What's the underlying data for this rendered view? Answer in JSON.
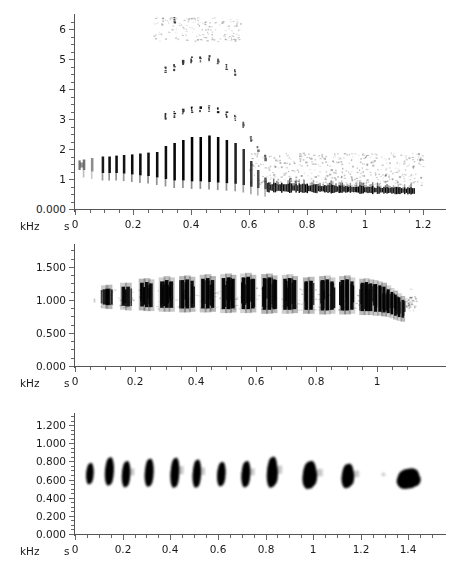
{
  "figure": {
    "title": "",
    "panel_count": 3,
    "background_color": "#ffffff",
    "ink_color": "#000000",
    "axis_color": "#555555"
  },
  "chart_data": [
    {
      "type": "heatmap",
      "title": "",
      "subtitle": "Spectrogram panel 1 - harmonic call with broadband pulse train",
      "xlabel": "s",
      "ylabel": "kHz",
      "xlim": [
        0,
        1.24
      ],
      "ylim": [
        0.0,
        6.4
      ],
      "xticks": [
        0,
        0.2,
        0.4,
        0.6,
        0.8,
        1,
        1.2
      ],
      "xticklabels": [
        "0",
        "0.2",
        "0.4",
        "0.6",
        "0.8",
        "1",
        "1.2"
      ],
      "xminor_step": 0.05,
      "yticks": [
        0,
        1,
        2,
        3,
        4,
        5,
        6
      ],
      "yticklabels": [
        "0.000",
        "1",
        "2",
        "3",
        "4",
        "5",
        "6"
      ],
      "yminor_step": 0.25,
      "grid": false,
      "legend": "none",
      "unit_x": "s",
      "unit_y": "kHz",
      "pulses": [
        {
          "t": 0.03,
          "f_low": 1.3,
          "f_high": 1.65,
          "top_harm": 1.8,
          "intensity": 0.55
        },
        {
          "t": 0.058,
          "f_low": 1.25,
          "f_high": 1.7,
          "top_harm": 1.9,
          "intensity": 0.45
        },
        {
          "t": 0.095,
          "f_low": 1.2,
          "f_high": 1.75,
          "top_harm": 2.0,
          "intensity": 0.9
        },
        {
          "t": 0.118,
          "f_low": 1.2,
          "f_high": 1.75,
          "top_harm": 2.0,
          "intensity": 0.95
        },
        {
          "t": 0.142,
          "f_low": 1.2,
          "f_high": 1.78,
          "top_harm": 2.1,
          "intensity": 0.95
        },
        {
          "t": 0.168,
          "f_low": 1.18,
          "f_high": 1.8,
          "top_harm": 2.2,
          "intensity": 0.92
        },
        {
          "t": 0.196,
          "f_low": 1.15,
          "f_high": 1.82,
          "top_harm": 2.3,
          "intensity": 0.95
        },
        {
          "t": 0.224,
          "f_low": 1.12,
          "f_high": 1.85,
          "top_harm": 2.4,
          "intensity": 0.95
        },
        {
          "t": 0.252,
          "f_low": 1.1,
          "f_high": 1.88,
          "top_harm": 2.5,
          "intensity": 0.95
        },
        {
          "t": 0.282,
          "f_low": 1.05,
          "f_high": 1.9,
          "top_harm": 2.8,
          "intensity": 0.95
        },
        {
          "t": 0.312,
          "f_low": 1.0,
          "f_high": 2.1,
          "top_harm": 4.6,
          "intensity": 0.95
        },
        {
          "t": 0.342,
          "f_low": 0.95,
          "f_high": 2.2,
          "top_harm": 6.3,
          "intensity": 0.98
        },
        {
          "t": 0.372,
          "f_low": 0.95,
          "f_high": 2.3,
          "top_harm": 6.3,
          "intensity": 0.98
        },
        {
          "t": 0.402,
          "f_low": 0.92,
          "f_high": 2.4,
          "top_harm": 6.3,
          "intensity": 1.0
        },
        {
          "t": 0.432,
          "f_low": 0.92,
          "f_high": 2.4,
          "top_harm": 6.3,
          "intensity": 1.0
        },
        {
          "t": 0.462,
          "f_low": 0.9,
          "f_high": 2.45,
          "top_harm": 6.3,
          "intensity": 1.0
        },
        {
          "t": 0.492,
          "f_low": 0.88,
          "f_high": 2.4,
          "top_harm": 6.3,
          "intensity": 0.98
        },
        {
          "t": 0.522,
          "f_low": 0.86,
          "f_high": 2.3,
          "top_harm": 6.0,
          "intensity": 0.95
        },
        {
          "t": 0.552,
          "f_low": 0.84,
          "f_high": 2.2,
          "top_harm": 5.4,
          "intensity": 0.88
        },
        {
          "t": 0.58,
          "f_low": 0.8,
          "f_high": 2.0,
          "top_harm": 3.1,
          "intensity": 0.8
        },
        {
          "t": 0.606,
          "f_low": 0.74,
          "f_high": 1.6,
          "top_harm": 2.6,
          "intensity": 0.75
        },
        {
          "t": 0.63,
          "f_low": 0.7,
          "f_high": 1.3,
          "top_harm": 2.1,
          "intensity": 0.7
        },
        {
          "t": 0.655,
          "f_low": 0.66,
          "f_high": 1.05,
          "top_harm": 1.6,
          "intensity": 0.65
        }
      ],
      "tail_band": {
        "t_start": 0.66,
        "t_end": 1.17,
        "f_center": 0.62,
        "f_width": 0.22,
        "note": "dense low-frequency pulse band descending to ~0.55 kHz"
      },
      "noise_band": {
        "t_start": 0.6,
        "t_end": 1.2,
        "f_center": 1.35,
        "f_width": 0.5,
        "note": "faint grey broadband residue"
      }
    },
    {
      "type": "heatmap",
      "title": "",
      "subtitle": "Spectrogram panel 2 - narrowband pulse train near 1 kHz",
      "xlabel": "s",
      "ylabel": "kHz",
      "xlim": [
        0,
        1.14
      ],
      "ylim": [
        0.0,
        1.8
      ],
      "xticks": [
        0,
        0.2,
        0.4,
        0.6,
        0.8,
        1
      ],
      "xticklabels": [
        "0",
        "0.2",
        "0.4",
        "0.6",
        "0.8",
        "1"
      ],
      "xminor_step": 0.05,
      "yticks": [
        0,
        0.5,
        1.0,
        1.5
      ],
      "yticklabels": [
        "0.000",
        "0.500",
        "1.000",
        "1.500"
      ],
      "yminor_step": 0.125,
      "grid": false,
      "legend": "none",
      "unit_x": "s",
      "unit_y": "kHz",
      "pulses": [
        {
          "t": 0.098,
          "f_low": 0.93,
          "f_high": 1.16,
          "intensity": 0.85,
          "width": 0.013
        },
        {
          "t": 0.112,
          "f_low": 0.92,
          "f_high": 1.17,
          "intensity": 0.88,
          "width": 0.012
        },
        {
          "t": 0.16,
          "f_low": 0.91,
          "f_high": 1.2,
          "intensity": 0.9,
          "width": 0.012
        },
        {
          "t": 0.176,
          "f_low": 0.9,
          "f_high": 1.2,
          "intensity": 0.9,
          "width": 0.012
        },
        {
          "t": 0.222,
          "f_low": 0.9,
          "f_high": 1.26,
          "intensity": 0.92,
          "width": 0.012
        },
        {
          "t": 0.238,
          "f_low": 0.89,
          "f_high": 1.27,
          "intensity": 0.93,
          "width": 0.012
        },
        {
          "t": 0.252,
          "f_low": 0.89,
          "f_high": 1.25,
          "intensity": 0.9,
          "width": 0.011
        },
        {
          "t": 0.288,
          "f_low": 0.88,
          "f_high": 1.28,
          "intensity": 0.93,
          "width": 0.012
        },
        {
          "t": 0.304,
          "f_low": 0.88,
          "f_high": 1.3,
          "intensity": 0.95,
          "width": 0.012
        },
        {
          "t": 0.32,
          "f_low": 0.88,
          "f_high": 1.28,
          "intensity": 0.92,
          "width": 0.011
        },
        {
          "t": 0.356,
          "f_low": 0.87,
          "f_high": 1.3,
          "intensity": 0.95,
          "width": 0.012
        },
        {
          "t": 0.372,
          "f_low": 0.87,
          "f_high": 1.31,
          "intensity": 0.95,
          "width": 0.012
        },
        {
          "t": 0.388,
          "f_low": 0.88,
          "f_high": 1.29,
          "intensity": 0.92,
          "width": 0.011
        },
        {
          "t": 0.424,
          "f_low": 0.87,
          "f_high": 1.32,
          "intensity": 0.95,
          "width": 0.012
        },
        {
          "t": 0.44,
          "f_low": 0.87,
          "f_high": 1.33,
          "intensity": 0.96,
          "width": 0.012
        },
        {
          "t": 0.456,
          "f_low": 0.88,
          "f_high": 1.3,
          "intensity": 0.92,
          "width": 0.011
        },
        {
          "t": 0.492,
          "f_low": 0.86,
          "f_high": 1.33,
          "intensity": 0.96,
          "width": 0.012
        },
        {
          "t": 0.508,
          "f_low": 0.86,
          "f_high": 1.34,
          "intensity": 0.97,
          "width": 0.012
        },
        {
          "t": 0.524,
          "f_low": 0.87,
          "f_high": 1.32,
          "intensity": 0.94,
          "width": 0.011
        },
        {
          "t": 0.558,
          "f_low": 0.86,
          "f_high": 1.34,
          "intensity": 0.97,
          "width": 0.012
        },
        {
          "t": 0.574,
          "f_low": 0.86,
          "f_high": 1.35,
          "intensity": 0.97,
          "width": 0.012
        },
        {
          "t": 0.59,
          "f_low": 0.87,
          "f_high": 1.32,
          "intensity": 0.94,
          "width": 0.011
        },
        {
          "t": 0.628,
          "f_low": 0.85,
          "f_high": 1.33,
          "intensity": 0.96,
          "width": 0.012
        },
        {
          "t": 0.644,
          "f_low": 0.85,
          "f_high": 1.34,
          "intensity": 0.97,
          "width": 0.012
        },
        {
          "t": 0.66,
          "f_low": 0.86,
          "f_high": 1.31,
          "intensity": 0.94,
          "width": 0.011
        },
        {
          "t": 0.696,
          "f_low": 0.85,
          "f_high": 1.32,
          "intensity": 0.95,
          "width": 0.012
        },
        {
          "t": 0.712,
          "f_low": 0.85,
          "f_high": 1.33,
          "intensity": 0.96,
          "width": 0.012
        },
        {
          "t": 0.728,
          "f_low": 0.86,
          "f_high": 1.3,
          "intensity": 0.93,
          "width": 0.011
        },
        {
          "t": 0.766,
          "f_low": 0.85,
          "f_high": 1.28,
          "intensity": 0.94,
          "width": 0.012
        },
        {
          "t": 0.782,
          "f_low": 0.85,
          "f_high": 1.29,
          "intensity": 0.95,
          "width": 0.012
        },
        {
          "t": 0.82,
          "f_low": 0.84,
          "f_high": 1.3,
          "intensity": 0.95,
          "width": 0.012
        },
        {
          "t": 0.836,
          "f_low": 0.84,
          "f_high": 1.31,
          "intensity": 0.96,
          "width": 0.012
        },
        {
          "t": 0.852,
          "f_low": 0.85,
          "f_high": 1.28,
          "intensity": 0.93,
          "width": 0.011
        },
        {
          "t": 0.886,
          "f_low": 0.84,
          "f_high": 1.3,
          "intensity": 0.95,
          "width": 0.012
        },
        {
          "t": 0.902,
          "f_low": 0.84,
          "f_high": 1.31,
          "intensity": 0.96,
          "width": 0.012
        },
        {
          "t": 0.918,
          "f_low": 0.85,
          "f_high": 1.28,
          "intensity": 0.93,
          "width": 0.011
        },
        {
          "t": 0.952,
          "f_low": 0.83,
          "f_high": 1.26,
          "intensity": 0.95,
          "width": 0.011
        },
        {
          "t": 0.966,
          "f_low": 0.83,
          "f_high": 1.27,
          "intensity": 0.96,
          "width": 0.011
        },
        {
          "t": 0.98,
          "f_low": 0.83,
          "f_high": 1.25,
          "intensity": 0.94,
          "width": 0.011
        },
        {
          "t": 0.996,
          "f_low": 0.82,
          "f_high": 1.24,
          "intensity": 0.95,
          "width": 0.01
        },
        {
          "t": 1.01,
          "f_low": 0.82,
          "f_high": 1.22,
          "intensity": 0.96,
          "width": 0.01
        },
        {
          "t": 1.024,
          "f_low": 0.81,
          "f_high": 1.2,
          "intensity": 0.97,
          "width": 0.01
        },
        {
          "t": 1.038,
          "f_low": 0.8,
          "f_high": 1.16,
          "intensity": 0.97,
          "width": 0.01
        },
        {
          "t": 1.05,
          "f_low": 0.78,
          "f_high": 1.12,
          "intensity": 0.97,
          "width": 0.009
        },
        {
          "t": 1.062,
          "f_low": 0.76,
          "f_high": 1.08,
          "intensity": 0.96,
          "width": 0.009
        },
        {
          "t": 1.074,
          "f_low": 0.74,
          "f_high": 1.04,
          "intensity": 0.94,
          "width": 0.009
        },
        {
          "t": 1.086,
          "f_low": 0.73,
          "f_high": 1.0,
          "intensity": 0.9,
          "width": 0.008
        }
      ]
    },
    {
      "type": "heatmap",
      "title": "",
      "subtitle": "Spectrogram panel 3 - discrete tonal notes near 0.65 kHz",
      "xlabel": "s",
      "ylabel": "kHz",
      "xlim": [
        0,
        1.52
      ],
      "ylim": [
        0.0,
        1.3
      ],
      "xticks": [
        0,
        0.2,
        0.4,
        0.6,
        0.8,
        1,
        1.2,
        1.4
      ],
      "xticklabels": [
        "0",
        "0.2",
        "0.4",
        "0.6",
        "0.8",
        "1",
        "1.2",
        "1.4"
      ],
      "xminor_step": 0.05,
      "yticks": [
        0,
        0.2,
        0.4,
        0.6,
        0.8,
        1.0,
        1.2
      ],
      "yticklabels": [
        "0.000",
        "0.200",
        "0.400",
        "0.600",
        "0.800",
        "1.000",
        "1.200"
      ],
      "yminor_step": 0.05,
      "grid": false,
      "legend": "none",
      "unit_x": "s",
      "unit_y": "kHz",
      "notes": [
        {
          "t": 0.063,
          "f": 0.665,
          "w": 0.03,
          "h": 0.115,
          "intensity": 1.0
        },
        {
          "t": 0.145,
          "f": 0.69,
          "w": 0.036,
          "h": 0.15,
          "intensity": 1.0
        },
        {
          "t": 0.215,
          "f": 0.66,
          "w": 0.034,
          "h": 0.14,
          "intensity": 1.0
        },
        {
          "t": 0.312,
          "f": 0.675,
          "w": 0.036,
          "h": 0.15,
          "intensity": 1.0
        },
        {
          "t": 0.42,
          "f": 0.675,
          "w": 0.036,
          "h": 0.16,
          "intensity": 1.0
        },
        {
          "t": 0.512,
          "f": 0.665,
          "w": 0.034,
          "h": 0.15,
          "intensity": 1.0
        },
        {
          "t": 0.615,
          "f": 0.66,
          "w": 0.034,
          "h": 0.13,
          "intensity": 1.0
        },
        {
          "t": 0.718,
          "f": 0.66,
          "w": 0.036,
          "h": 0.14,
          "intensity": 1.0
        },
        {
          "t": 0.828,
          "f": 0.68,
          "w": 0.042,
          "h": 0.165,
          "intensity": 1.0
        },
        {
          "t": 0.985,
          "f": 0.65,
          "w": 0.055,
          "h": 0.15,
          "intensity": 1.0
        },
        {
          "t": 1.145,
          "f": 0.64,
          "w": 0.048,
          "h": 0.13,
          "intensity": 1.0
        },
        {
          "t": 1.4,
          "f": 0.61,
          "w": 0.09,
          "h": 0.11,
          "intensity": 1.0
        }
      ]
    }
  ]
}
